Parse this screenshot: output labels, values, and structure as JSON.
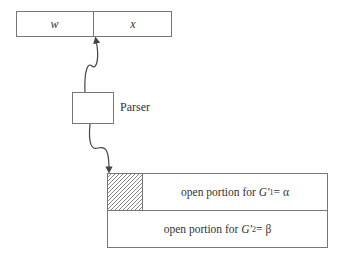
{
  "input_tape": {
    "cells": [
      {
        "label": "w"
      },
      {
        "label": "x"
      }
    ]
  },
  "parser": {
    "label": "Parser"
  },
  "output_area": {
    "rows": [
      {
        "prefix": "open portion for ",
        "symbol": "G′",
        "subscript": "1",
        "suffix": " = α"
      },
      {
        "prefix": "open portion for ",
        "symbol": "G′",
        "subscript": "2",
        "suffix": " = β"
      }
    ],
    "hatched_region": "filled portion"
  }
}
